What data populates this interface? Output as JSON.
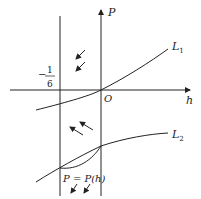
{
  "diagram": {
    "axes": {
      "x_label": "h",
      "y_label": "P",
      "origin_label": "O"
    },
    "vertical_line_label": {
      "minus": "−",
      "numerator": "1",
      "denominator": "6"
    },
    "curves": {
      "L1": "L",
      "L1_sub": "1",
      "L2": "L",
      "L2_sub": "2"
    },
    "curve_label": "P = P(h)",
    "colors": {
      "stroke": "#222222",
      "background": "#ffffff"
    }
  }
}
